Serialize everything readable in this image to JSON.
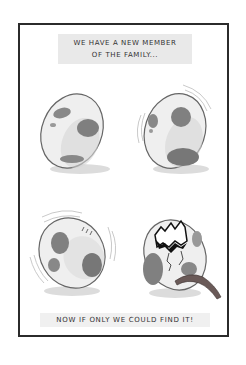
{
  "comic": {
    "caption_top_line1": "We have a new member",
    "caption_top_line2": "of the family...",
    "caption_bottom": "Now if only we could find it!"
  },
  "panels": [
    {
      "name": "egg-still",
      "description": "Spotted egg sitting still"
    },
    {
      "name": "egg-wobbling",
      "description": "Spotted egg wobbling with motion lines"
    },
    {
      "name": "egg-shaking",
      "description": "Spotted egg shaking with motion lines"
    },
    {
      "name": "egg-hatched",
      "description": "Cracked open egg with a tail sticking out"
    }
  ],
  "colors": {
    "border": "#2b2b2b",
    "egg_fill": "#efefef",
    "egg_outline": "#666666",
    "spot": "#888888",
    "shadow": "#c8c8c8",
    "caption_bg": "#e9e9e9",
    "crack": "#111111",
    "tail": "#6a5a58"
  }
}
